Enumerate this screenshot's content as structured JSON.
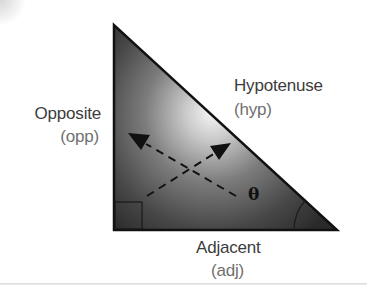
{
  "diagram": {
    "labels": {
      "opposite": "Opposite",
      "opposite_abbr": "(opp)",
      "hypotenuse": "Hypotenuse",
      "hypotenuse_abbr": "(hyp)",
      "adjacent": "Adjacent",
      "adjacent_abbr": "(adj)",
      "angle": "θ"
    },
    "shapes": {
      "triangle_vertices": [
        [
          114,
          25
        ],
        [
          114,
          230
        ],
        [
          337,
          230
        ]
      ],
      "right_angle_marker": "square at bottom-left corner",
      "angle_arc": "arc at bottom-right vertex marking θ",
      "arrows": [
        {
          "name": "arrow-to-opposite",
          "from": [
            236,
            196
          ],
          "to": [
            128,
            133
          ],
          "style": "dashed"
        },
        {
          "name": "arrow-to-hypotenuse",
          "from": [
            147,
            196
          ],
          "to": [
            231,
            143
          ],
          "style": "dashed"
        }
      ]
    },
    "colors": {
      "triangle_dark": "#2e2e2e",
      "triangle_highlight": "#f4f4f4",
      "outline": "#111111",
      "label_text": "#3c3c3c",
      "abbr_text": "#707070"
    }
  }
}
